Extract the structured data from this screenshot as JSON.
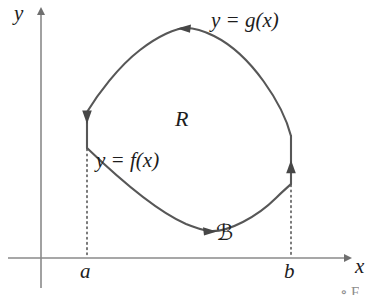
{
  "figure": {
    "background_color": "#ffffff",
    "curve_color": "#555555",
    "axis_color": "#808080",
    "text_color": "#1d1d1d"
  },
  "axes": {
    "y_label": "y",
    "x_label": "x",
    "x_tick_left_label": "a",
    "x_tick_right_label": "b",
    "origin_px": {
      "x": 41,
      "y": 258
    },
    "x_axis_y_px": 258,
    "y_axis_x_px": 41,
    "a_x_px": 87,
    "b_x_px": 291
  },
  "labels": {
    "upper_curve": "y = g(x)",
    "lower_curve": "y = f(x)",
    "region": "R",
    "boundary_curve": "ℬ"
  },
  "curves": {
    "upper": {
      "name": "y = g(x)",
      "description": "upper boundary arc from (291,136) up over apex (186,28) down to (87,112)",
      "orientation_arrow": "left",
      "arrow_at_px": {
        "x": 186,
        "y": 29
      }
    },
    "lower": {
      "name": "y = f(x)",
      "description": "lower boundary arc from (87,148) down through trough (208,231) up to (291,184)",
      "orientation_arrow": "right",
      "arrow_at_px": {
        "x": 209,
        "y": 231
      }
    },
    "left_segment": {
      "name": "vertical segment at x = a",
      "orientation_arrow": "down",
      "from_px": {
        "x": 87,
        "y": 112
      },
      "to_px": {
        "x": 87,
        "y": 148
      }
    },
    "right_segment": {
      "name": "vertical segment at x = b",
      "orientation_arrow": "up",
      "from_px": {
        "x": 291,
        "y": 184
      },
      "to_px": {
        "x": 291,
        "y": 136
      }
    }
  },
  "dotted_guides": [
    {
      "name": "guide-at-a",
      "x_px": 87,
      "from_y_px": 148,
      "to_y_px": 258
    },
    {
      "name": "guide-at-b",
      "x_px": 291,
      "from_y_px": 184,
      "to_y_px": 258
    }
  ],
  "artifacts": {
    "bottom_fragment": "∘ F"
  }
}
